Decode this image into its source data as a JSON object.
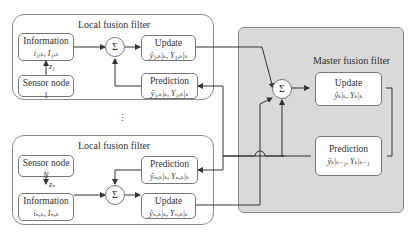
{
  "local_top": {
    "title": "Local fusion filter",
    "information": {
      "label": "Information",
      "sub": "i₁,ₖ, I₁,ₖ"
    },
    "sensor": {
      "label": "Sensor node",
      "sub": "1"
    },
    "measurement": "z₁",
    "sum": "Σ",
    "update": {
      "label": "Update",
      "sub": "ŷ₁,ₖ|ₖ, Y₁,ₖ|ₖ"
    },
    "prediction": {
      "label": "Prediction",
      "sub": "ŷ₁,ₖ|ₖ, Y₁,ₖ|ₖ"
    }
  },
  "ellipsis": "⋮",
  "local_bottom": {
    "title": "Local fusion filter",
    "sensor": {
      "label": "Sensor node",
      "sub": "N"
    },
    "measurement": "zₙ",
    "information": {
      "label": "Information",
      "sub": "iₙ,ₖ, Iₙ,ₖ"
    },
    "sum": "Σ",
    "prediction": {
      "label": "Prediction",
      "sub": "ŷₙ,ₖ|ₖ, Yₙ,ₖ|ₖ"
    },
    "update": {
      "label": "Update",
      "sub": "ŷₙ,ₖ|ₖ, Yₙ,ₖ|ₖ"
    }
  },
  "master": {
    "title": "Master fusion filter",
    "sum": "Σ",
    "update": {
      "label": "Update",
      "sub": "ŷₖ|ₖ, Yₖ|ₖ"
    },
    "prediction": {
      "label": "Prediction",
      "sub": "ŷₖ|ₖ₋₁, Yₖ|ₖ₋₁"
    }
  }
}
